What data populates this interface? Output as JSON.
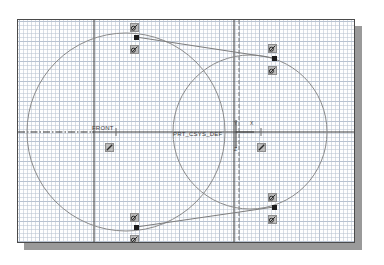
{
  "window": {
    "title": "Sketcher Graphics Window",
    "background_color": "#fdfdfd",
    "frame_color": "#4a4a4a",
    "shadow_color": "#9a9a9a",
    "grid": {
      "visible": true,
      "minor_spacing_px": 4,
      "major_spacing_px": 20,
      "color": "#8aa0bd"
    }
  },
  "labels": {
    "datum_plane_front": "FRONT",
    "coordinate_system": "PRT_CSYS_DEF",
    "axis_y": "Y",
    "axis_x": "X",
    "axis_z": "Z"
  },
  "geometry": {
    "entity_color": "#7a7a7a",
    "centerline_color": "#2e2e2e",
    "datum_color": "#4a4a4a",
    "circles": [
      {
        "name": "left-circle",
        "cx": 125,
        "cy": 131,
        "r": 99
      },
      {
        "name": "right-circle",
        "cx": 249,
        "cy": 131,
        "r": 77
      }
    ],
    "tangent_lines": [
      {
        "name": "top-tangent",
        "x1": 135,
        "y1": 36,
        "x2": 273,
        "y2": 57
      },
      {
        "name": "bottom-tangent",
        "x1": 135,
        "y1": 226,
        "x2": 273,
        "y2": 206
      }
    ],
    "centerlines": [
      {
        "name": "horizontal-centerline",
        "x1": 17,
        "y1": 131,
        "x2": 355,
        "y2": 131,
        "style": "dash-dot-then-solid"
      },
      {
        "name": "vertical-datum-front",
        "x": 93,
        "y1": 19,
        "y2": 243,
        "style": "solid"
      },
      {
        "name": "vertical-datum-right-a",
        "x": 233,
        "y1": 19,
        "y2": 243,
        "style": "solid"
      },
      {
        "name": "vertical-datum-right-b",
        "x": 238,
        "y1": 19,
        "y2": 243,
        "style": "dashed"
      }
    ]
  },
  "sketch_points": [
    {
      "name": "point-top-left",
      "x": 135,
      "y": 36
    },
    {
      "name": "point-top-right",
      "x": 273,
      "y": 57
    },
    {
      "name": "point-bottom-left",
      "x": 135,
      "y": 226
    },
    {
      "name": "point-bottom-right",
      "x": 273,
      "y": 206
    }
  ],
  "constraints": [
    {
      "name": "tangent-constraint-1",
      "glyph": "tangent-icon",
      "x": 131,
      "y": 22
    },
    {
      "name": "tangent-constraint-2",
      "glyph": "tangent-icon",
      "x": 131,
      "y": 44
    },
    {
      "name": "tangent-constraint-3",
      "glyph": "tangent-icon",
      "x": 269,
      "y": 43
    },
    {
      "name": "tangent-constraint-4",
      "glyph": "tangent-icon",
      "x": 269,
      "y": 65
    },
    {
      "name": "tangent-constraint-5",
      "glyph": "tangent-icon",
      "x": 131,
      "y": 212
    },
    {
      "name": "tangent-constraint-6",
      "glyph": "tangent-icon",
      "x": 131,
      "y": 234
    },
    {
      "name": "tangent-constraint-7",
      "glyph": "tangent-icon",
      "x": 269,
      "y": 192
    },
    {
      "name": "tangent-constraint-8",
      "glyph": "tangent-icon",
      "x": 269,
      "y": 214
    },
    {
      "name": "equal-constraint-left",
      "glyph": "tangent-icon",
      "x": 106,
      "y": 142
    },
    {
      "name": "equal-constraint-right",
      "glyph": "tangent-icon",
      "x": 258,
      "y": 142
    }
  ]
}
